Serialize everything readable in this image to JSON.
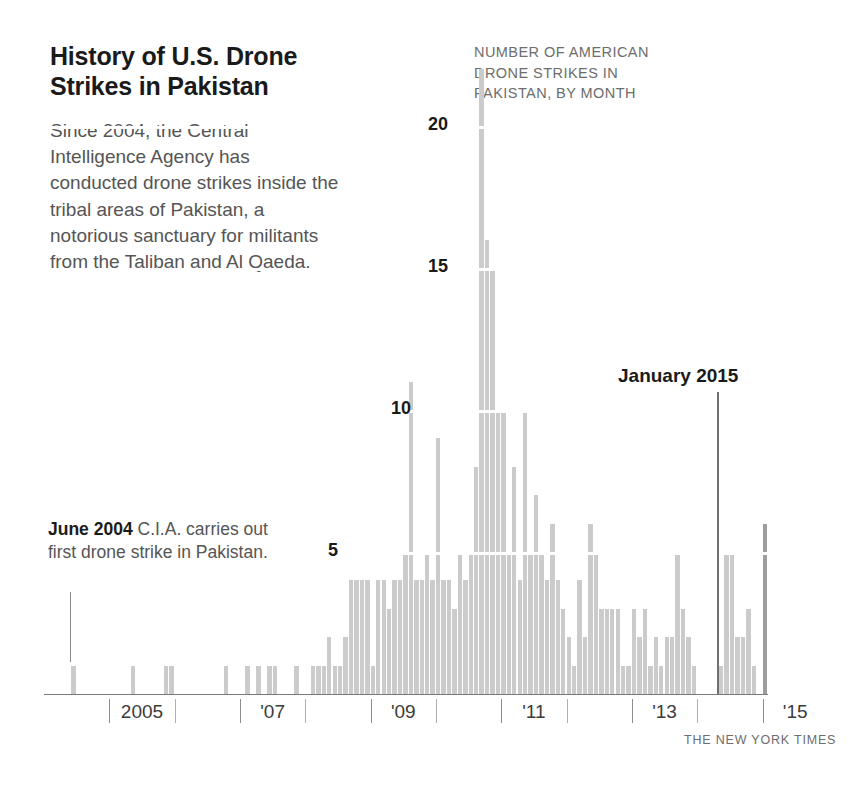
{
  "headline": "History of U.S. Drone Strikes in Pakistan",
  "deck": "Since 2004, the Central Intelligence Agency has conducted drone strikes inside the tribal areas of Pakistan, a notorious sanctuary for militants from the Taliban and Al Qaeda.",
  "chart_caption": "NUMBER OF AMERICAN DRONE STRIKES IN PAKISTAN, BY MONTH",
  "annotations": {
    "left": {
      "bold": "June 2004",
      "rest": " C.I.A. carries out first drone strike in Pakistan."
    },
    "right": {
      "label": "January 2015"
    }
  },
  "credit": "THE NEW YORK TIMES",
  "colors": {
    "bar": "#cbcbcb",
    "bar_highlight": "#9d9d9d",
    "axis": "#7a7a7a",
    "gridline": "#ffffff",
    "text_dark": "#1a1a1a",
    "text_muted": "#6d6d6d"
  },
  "chart_data": {
    "type": "bar",
    "title": "NUMBER OF AMERICAN DRONE STRIKES IN PAKISTAN, BY MONTH",
    "xlabel": "",
    "ylabel": "",
    "ylim": [
      0,
      23
    ],
    "yticks": [
      5,
      10,
      15,
      20
    ],
    "ytick_labels": [
      "5",
      "10",
      "15",
      "20"
    ],
    "grid": true,
    "legend": "none",
    "x_axis_labels": [
      "2005",
      "'07",
      "'09",
      "'11",
      "'13",
      "'15"
    ],
    "x_axis_label_years": [
      2005,
      2007,
      2009,
      2011,
      2013,
      2015
    ],
    "x_tick_years": [
      2005,
      2006,
      2007,
      2008,
      2009,
      2010,
      2011,
      2012,
      2013,
      2014,
      2015
    ],
    "x_start": "2004-01",
    "x_end": "2015-01",
    "highlight_month": "2015-01",
    "highlight_value": 6,
    "bar_interval": "monthly",
    "categories": [
      "2004-01",
      "2004-02",
      "2004-03",
      "2004-04",
      "2004-05",
      "2004-06",
      "2004-07",
      "2004-08",
      "2004-09",
      "2004-10",
      "2004-11",
      "2004-12",
      "2005-01",
      "2005-02",
      "2005-03",
      "2005-04",
      "2005-05",
      "2005-06",
      "2005-07",
      "2005-08",
      "2005-09",
      "2005-10",
      "2005-11",
      "2005-12",
      "2006-01",
      "2006-02",
      "2006-03",
      "2006-04",
      "2006-05",
      "2006-06",
      "2006-07",
      "2006-08",
      "2006-09",
      "2006-10",
      "2006-11",
      "2006-12",
      "2007-01",
      "2007-02",
      "2007-03",
      "2007-04",
      "2007-05",
      "2007-06",
      "2007-07",
      "2007-08",
      "2007-09",
      "2007-10",
      "2007-11",
      "2007-12",
      "2008-01",
      "2008-02",
      "2008-03",
      "2008-04",
      "2008-05",
      "2008-06",
      "2008-07",
      "2008-08",
      "2008-09",
      "2008-10",
      "2008-11",
      "2008-12",
      "2009-01",
      "2009-02",
      "2009-03",
      "2009-04",
      "2009-05",
      "2009-06",
      "2009-07",
      "2009-08",
      "2009-09",
      "2009-10",
      "2009-11",
      "2009-12",
      "2010-01",
      "2010-02",
      "2010-03",
      "2010-04",
      "2010-05",
      "2010-06",
      "2010-07",
      "2010-08",
      "2010-09",
      "2010-10",
      "2010-11",
      "2010-12",
      "2011-01",
      "2011-02",
      "2011-03",
      "2011-04",
      "2011-05",
      "2011-06",
      "2011-07",
      "2011-08",
      "2011-09",
      "2011-10",
      "2011-11",
      "2011-12",
      "2012-01",
      "2012-02",
      "2012-03",
      "2012-04",
      "2012-05",
      "2012-06",
      "2012-07",
      "2012-08",
      "2012-09",
      "2012-10",
      "2012-11",
      "2012-12",
      "2013-01",
      "2013-02",
      "2013-03",
      "2013-04",
      "2013-05",
      "2013-06",
      "2013-07",
      "2013-08",
      "2013-09",
      "2013-10",
      "2013-11",
      "2013-12",
      "2014-01",
      "2014-02",
      "2014-03",
      "2014-04",
      "2014-05",
      "2014-06",
      "2014-07",
      "2014-08",
      "2014-09",
      "2014-10",
      "2014-11",
      "2014-12",
      "2015-01"
    ],
    "values": [
      0,
      0,
      0,
      0,
      0,
      1,
      0,
      0,
      0,
      0,
      0,
      0,
      0,
      0,
      0,
      0,
      1,
      0,
      0,
      0,
      0,
      0,
      1,
      1,
      0,
      0,
      0,
      0,
      0,
      0,
      0,
      0,
      0,
      1,
      0,
      0,
      0,
      1,
      0,
      1,
      0,
      1,
      1,
      0,
      0,
      0,
      1,
      0,
      0,
      1,
      1,
      1,
      2,
      1,
      1,
      2,
      4,
      4,
      4,
      4,
      1,
      4,
      4,
      3,
      4,
      4,
      5,
      11,
      4,
      4,
      5,
      4,
      9,
      4,
      4,
      3,
      5,
      4,
      5,
      8,
      22,
      16,
      15,
      10,
      10,
      5,
      8,
      4,
      10,
      5,
      7,
      5,
      4,
      6,
      4,
      3,
      2,
      1,
      4,
      2,
      6,
      5,
      3,
      3,
      3,
      3,
      1,
      1,
      3,
      2,
      3,
      1,
      2,
      1,
      2,
      2,
      5,
      3,
      2,
      1,
      0,
      0,
      0,
      0,
      1,
      5,
      5,
      2,
      2,
      3,
      1,
      0,
      6
    ]
  }
}
